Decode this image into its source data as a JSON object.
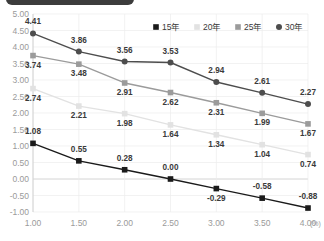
{
  "header": {
    "badge_label": ""
  },
  "chart_data": {
    "type": "line",
    "title": "",
    "xlabel": "(%)",
    "ylabel": "",
    "x": [
      1.0,
      1.5,
      2.0,
      2.5,
      3.0,
      3.5,
      4.0
    ],
    "xtick_labels": [
      "1.00",
      "1.50",
      "2.00",
      "2.50",
      "3.00",
      "3.50",
      "4.00"
    ],
    "ytick_labels": [
      "5.00",
      "4.50",
      "4.00",
      "3.50",
      "3.00",
      "2.50",
      "2.00",
      "1.50",
      "1.00",
      "0.50",
      "0.00",
      "-0.50",
      "-1.00"
    ],
    "ylim": [
      -1.0,
      5.0
    ],
    "xlim": [
      1.0,
      4.0
    ],
    "grid": true,
    "legend_position": "top-right",
    "series": [
      {
        "name": "15年",
        "color": "#1a1a1a",
        "marker": "square",
        "values": [
          1.08,
          0.55,
          0.28,
          0.0,
          -0.29,
          -0.58,
          -0.88
        ],
        "labels": [
          "1.08",
          "0.55",
          "0.28",
          "0.00",
          "-0.29",
          "-0.58",
          "-0.88"
        ]
      },
      {
        "name": "20年",
        "color": "#e2e2e2",
        "marker": "square",
        "values": [
          2.74,
          2.21,
          1.98,
          1.64,
          1.34,
          1.04,
          0.74
        ],
        "labels": [
          "2.74",
          "2.21",
          "1.98",
          "1.64",
          "1.34",
          "1.04",
          "0.74"
        ]
      },
      {
        "name": "25年",
        "color": "#9b9b9b",
        "marker": "square",
        "values": [
          3.74,
          3.48,
          2.91,
          2.62,
          2.31,
          1.99,
          1.67
        ],
        "labels": [
          "3.74",
          "3.48",
          "2.91",
          "2.62",
          "2.31",
          "1.99",
          "1.67"
        ]
      },
      {
        "name": "30年",
        "color": "#4d4d4d",
        "marker": "circle",
        "values": [
          4.41,
          3.86,
          3.56,
          3.53,
          2.94,
          2.61,
          2.27
        ],
        "labels": [
          "4.41",
          "3.86",
          "3.56",
          "3.53",
          "2.94",
          "2.61",
          "2.27"
        ]
      }
    ],
    "label_offsets": {
      "15年": [
        [
          0,
          -9
        ],
        [
          0,
          -9
        ],
        [
          0,
          -9
        ],
        [
          0,
          -9
        ],
        [
          0,
          12
        ],
        [
          0,
          -9
        ],
        [
          0,
          -9
        ]
      ],
      "20年": [
        [
          0,
          12
        ],
        [
          0,
          12
        ],
        [
          0,
          12
        ],
        [
          0,
          12
        ],
        [
          0,
          12
        ],
        [
          0,
          12
        ],
        [
          0,
          12
        ]
      ],
      "25年": [
        [
          0,
          12
        ],
        [
          0,
          12
        ],
        [
          0,
          12
        ],
        [
          0,
          12
        ],
        [
          0,
          12
        ],
        [
          0,
          12
        ],
        [
          0,
          12
        ]
      ],
      "30年": [
        [
          0,
          -9
        ],
        [
          0,
          -9
        ],
        [
          0,
          -9
        ],
        [
          0,
          -9
        ],
        [
          0,
          -9
        ],
        [
          0,
          -9
        ],
        [
          0,
          -9
        ]
      ]
    }
  }
}
